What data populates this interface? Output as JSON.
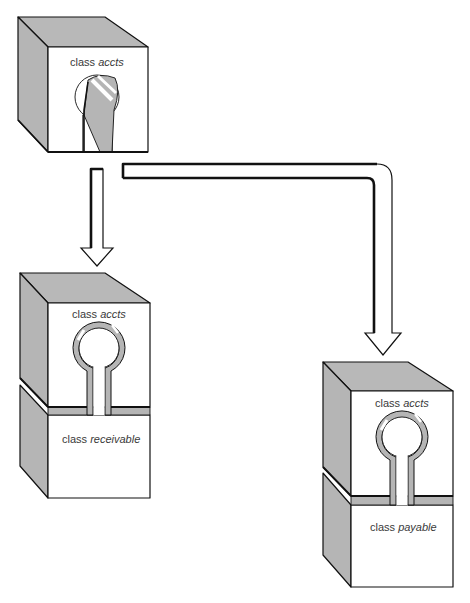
{
  "diagram": {
    "type": "class-inheritance-illustration",
    "base_block": {
      "label_prefix": "class",
      "label_name": "accts"
    },
    "derived_blocks": [
      {
        "position": "left",
        "base_label_prefix": "class",
        "base_label_name": "accts",
        "label_prefix": "class",
        "label_name": "receivable"
      },
      {
        "position": "right",
        "base_label_prefix": "class",
        "base_label_name": "accts",
        "label_prefix": "class",
        "label_name": "payable"
      }
    ],
    "arrows": [
      {
        "from": "accts",
        "to": "receivable",
        "direction": "down"
      },
      {
        "from": "accts",
        "to": "payable",
        "direction": "right-then-down"
      }
    ],
    "colors": {
      "shade": "#b5b5b5",
      "outline": "#111111",
      "face": "#ffffff",
      "text": "#3a3a3a"
    }
  }
}
